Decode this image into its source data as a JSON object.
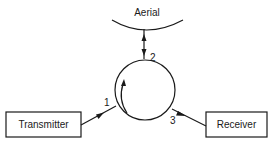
{
  "diagram": {
    "aerial": {
      "label": "Aerial"
    },
    "transmitter": {
      "label": "Transmitter"
    },
    "receiver": {
      "label": "Receiver"
    },
    "circulator": {
      "ports": [
        {
          "id": "1",
          "label": "1",
          "connects_to": "Transmitter",
          "direction": "in"
        },
        {
          "id": "2",
          "label": "2",
          "connects_to": "Aerial",
          "direction": "bidirectional"
        },
        {
          "id": "3",
          "label": "3",
          "connects_to": "Receiver",
          "direction": "out"
        }
      ],
      "rotation": "clockwise"
    }
  }
}
